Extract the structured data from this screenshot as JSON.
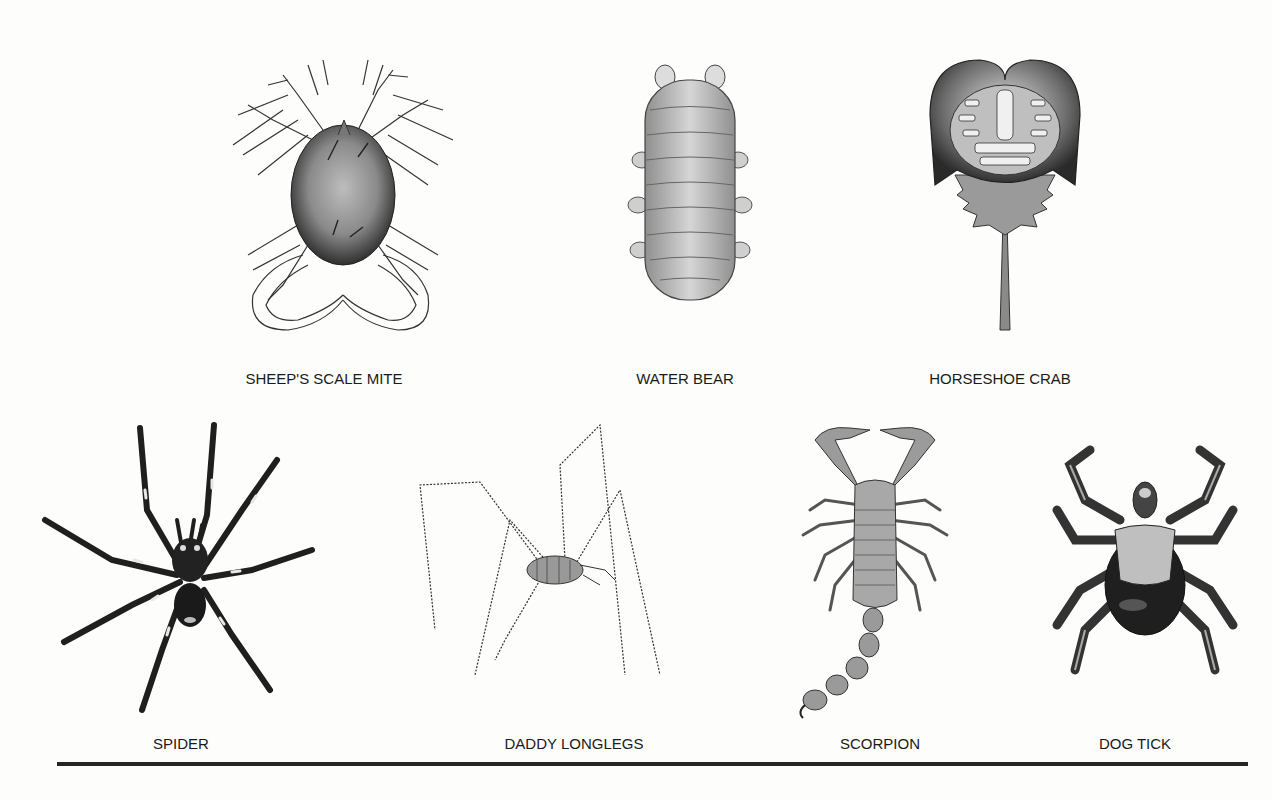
{
  "page": {
    "type": "illustration-plate",
    "background": "#fdfdfc"
  },
  "figures": [
    {
      "id": "sheeps-scale-mite",
      "label": "SHEEP'S SCALE MITE"
    },
    {
      "id": "water-bear",
      "label": "WATER BEAR"
    },
    {
      "id": "horseshoe-crab",
      "label": "HORSESHOE CRAB"
    },
    {
      "id": "spider",
      "label": "SPIDER"
    },
    {
      "id": "daddy-longlegs",
      "label": "DADDY LONGLEGS"
    },
    {
      "id": "scorpion",
      "label": "SCORPION"
    },
    {
      "id": "dog-tick",
      "label": "DOG TICK"
    }
  ],
  "footer_rule": {
    "color": "#262626"
  }
}
